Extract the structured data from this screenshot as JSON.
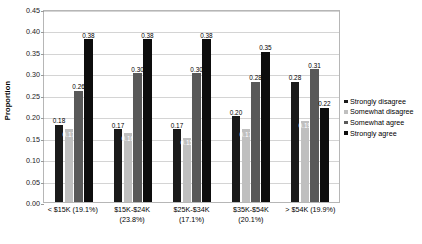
{
  "chart_data": {
    "type": "bar",
    "title": "",
    "xlabel": "",
    "ylabel": "Proportion",
    "ylim": [
      0.0,
      0.45
    ],
    "ytick_step": 0.05,
    "grid": true,
    "legend_position": "right",
    "categories": [
      "< $15K (19.1%)",
      "$15K-$24K (23.8%)",
      "$25K-$34K (17.1%)",
      "$35K-$54K (20.1%)",
      "> $54K (19.9%)"
    ],
    "ytick_labels": [
      "0.00",
      "0.05",
      "0.10",
      "0.15",
      "0.20",
      "0.25",
      "0.30",
      "0.35",
      "0.40",
      "0.45"
    ],
    "series": [
      {
        "name": "Strongly disagree",
        "color": "#1a1a1a",
        "values": [
          0.18,
          0.17,
          0.17,
          0.2,
          0.28
        ],
        "labels": [
          "0.18",
          "0.17",
          "0.17",
          "0.20",
          "0.28"
        ]
      },
      {
        "name": "Somewhat disagree",
        "color": "#bfbfbf",
        "values": [
          0.17,
          0.16,
          0.15,
          0.17,
          0.19
        ],
        "labels": [
          "0.17",
          "0.16",
          "0.15",
          "0.17",
          "0.19"
        ]
      },
      {
        "name": "Somewhat agree",
        "color": "#595959",
        "values": [
          0.26,
          0.3,
          0.3,
          0.28,
          0.31
        ],
        "labels": [
          "0.26",
          "0.30",
          "0.30",
          "0.28",
          "0.31"
        ]
      },
      {
        "name": "Strongly agree",
        "color": "#0d0d0d",
        "values": [
          0.38,
          0.38,
          0.38,
          0.35,
          0.22
        ],
        "labels": [
          "0.38",
          "0.38",
          "0.38",
          "0.35",
          "0.22"
        ]
      }
    ]
  },
  "legend": {
    "items": [
      {
        "label": "Strongly disagree",
        "color": "#1a1a1a"
      },
      {
        "label": "Somewhat disagree",
        "color": "#bfbfbf"
      },
      {
        "label": "Somewhat agree",
        "color": "#595959"
      },
      {
        "label": "Strongly agree",
        "color": "#0d0d0d"
      }
    ]
  }
}
